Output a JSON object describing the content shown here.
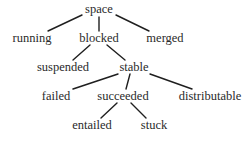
{
  "diagram": {
    "type": "tree",
    "root": "space",
    "nodes": [
      {
        "id": "space",
        "label": "space",
        "x": 99,
        "y": 13
      },
      {
        "id": "running",
        "label": "running",
        "x": 32,
        "y": 42
      },
      {
        "id": "blocked",
        "label": "blocked",
        "x": 99,
        "y": 42
      },
      {
        "id": "merged",
        "label": "merged",
        "x": 165,
        "y": 42
      },
      {
        "id": "suspended",
        "label": "suspended",
        "x": 63,
        "y": 71
      },
      {
        "id": "stable",
        "label": "stable",
        "x": 134,
        "y": 71
      },
      {
        "id": "failed",
        "label": "failed",
        "x": 56,
        "y": 100
      },
      {
        "id": "succeeded",
        "label": "succeeded",
        "x": 123,
        "y": 100
      },
      {
        "id": "distributable",
        "label": "distributable",
        "x": 210,
        "y": 100
      },
      {
        "id": "entailed",
        "label": "entailed",
        "x": 92,
        "y": 129
      },
      {
        "id": "stuck",
        "label": "stuck",
        "x": 154,
        "y": 129
      }
    ],
    "edges": [
      {
        "from": "space",
        "to": "running",
        "x1": 82,
        "y1": 15,
        "x2": 48,
        "y2": 31
      },
      {
        "from": "space",
        "to": "blocked",
        "x1": 99,
        "y1": 17,
        "x2": 99,
        "y2": 31
      },
      {
        "from": "space",
        "to": "merged",
        "x1": 116,
        "y1": 15,
        "x2": 149,
        "y2": 31
      },
      {
        "from": "blocked",
        "to": "suspended",
        "x1": 90,
        "y1": 45,
        "x2": 73,
        "y2": 60
      },
      {
        "from": "blocked",
        "to": "stable",
        "x1": 107,
        "y1": 45,
        "x2": 125,
        "y2": 60
      },
      {
        "from": "stable",
        "to": "failed",
        "x1": 118,
        "y1": 74,
        "x2": 73,
        "y2": 89
      },
      {
        "from": "stable",
        "to": "succeeded",
        "x1": 130,
        "y1": 74,
        "x2": 126,
        "y2": 89
      },
      {
        "from": "stable",
        "to": "distributable",
        "x1": 150,
        "y1": 74,
        "x2": 192,
        "y2": 89
      },
      {
        "from": "succeeded",
        "to": "entailed",
        "x1": 117,
        "y1": 103,
        "x2": 101,
        "y2": 118
      },
      {
        "from": "succeeded",
        "to": "stuck",
        "x1": 131,
        "y1": 103,
        "x2": 146,
        "y2": 118
      }
    ]
  }
}
